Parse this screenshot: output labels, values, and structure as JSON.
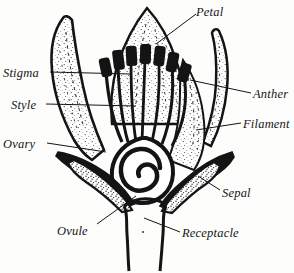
{
  "figure": {
    "background_color": "#fdfdfc",
    "ink_color": "#141414"
  },
  "labels": {
    "stigma": "Stigma",
    "style": "Style",
    "ovary": "Ovary",
    "ovule": "Ovule",
    "petal": "Petal",
    "anther": "Anther",
    "filament": "Filament",
    "sepal": "Sepal",
    "receptacle": "Receptacle"
  },
  "parts": [
    {
      "name": "petal",
      "label": "Petal",
      "side": "right"
    },
    {
      "name": "anther",
      "label": "Anther",
      "side": "right"
    },
    {
      "name": "filament",
      "label": "Filament",
      "side": "right"
    },
    {
      "name": "sepal",
      "label": "Sepal",
      "side": "right"
    },
    {
      "name": "receptacle",
      "label": "Receptacle",
      "side": "bottom-right"
    },
    {
      "name": "stigma",
      "label": "Stigma",
      "side": "left"
    },
    {
      "name": "style",
      "label": "Style",
      "side": "left"
    },
    {
      "name": "ovary",
      "label": "Ovary",
      "side": "left"
    },
    {
      "name": "ovule",
      "label": "Ovule",
      "side": "bottom-left"
    }
  ]
}
